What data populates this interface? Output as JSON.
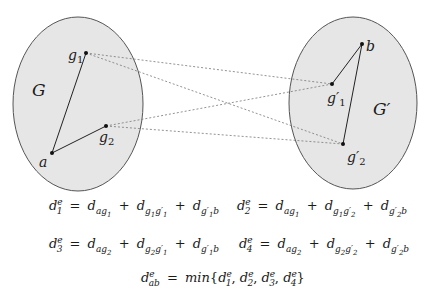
{
  "diagram": {
    "left_graph": {
      "label": "G",
      "nodes": [
        {
          "id": "g1",
          "label": "g",
          "sub": "1",
          "x": 86,
          "y": 53
        },
        {
          "id": "g2",
          "label": "g",
          "sub": "2",
          "x": 106,
          "y": 126
        },
        {
          "id": "a",
          "label": "a",
          "x": 52,
          "y": 153
        }
      ],
      "edges": [
        [
          "a",
          "g1"
        ],
        [
          "a",
          "g2"
        ]
      ]
    },
    "right_graph": {
      "label": "G′",
      "nodes": [
        {
          "id": "b",
          "label": "b",
          "x": 362,
          "y": 44
        },
        {
          "id": "g1p",
          "label": "g′",
          "sub": "1",
          "x": 332,
          "y": 84
        },
        {
          "id": "g2p",
          "label": "g′",
          "sub": "2",
          "x": 343,
          "y": 144
        }
      ],
      "edges": [
        [
          "b",
          "g1p"
        ],
        [
          "b",
          "g2p"
        ]
      ]
    },
    "cross_edges_dashed": [
      [
        "g1",
        "g1p"
      ],
      [
        "g1",
        "g2p"
      ],
      [
        "g2",
        "g1p"
      ],
      [
        "g2",
        "g2p"
      ]
    ],
    "colors": {
      "ellipse_fill": "#e6e6e6",
      "ellipse_stroke": "#555555",
      "dashed": "#777777",
      "edge": "#222222"
    }
  },
  "equations": {
    "eq1": "d₁ᵉ = d_ag₁ + d_g₁g′₁ + d_g′₁b",
    "eq2": "d₂ᵉ = d_ag₁ + d_g₁g′₂ + d_g′₂b",
    "eq3": "d₃ᵉ = d_ag₂ + d_g₂g′₁ + d_g′₁b",
    "eq4": "d₄ᵉ = d_ag₂ + d_g₂g′₂ + d_g′₂b",
    "eq5": "d_abᵉ = min{d₁ᵉ, d₂ᵉ, d₃ᵉ, d₄ᵉ}"
  },
  "labels": {
    "G": "G",
    "Gp": "G′",
    "a": "a",
    "b": "b",
    "g": "g",
    "gp": "g′",
    "s1": "1",
    "s2": "2",
    "d": "d",
    "e": "e",
    "eq": "=",
    "plus": "+",
    "min": "min",
    "lbrace": "{",
    "rbrace": "}",
    "comma": ",",
    "ab": "ab"
  }
}
